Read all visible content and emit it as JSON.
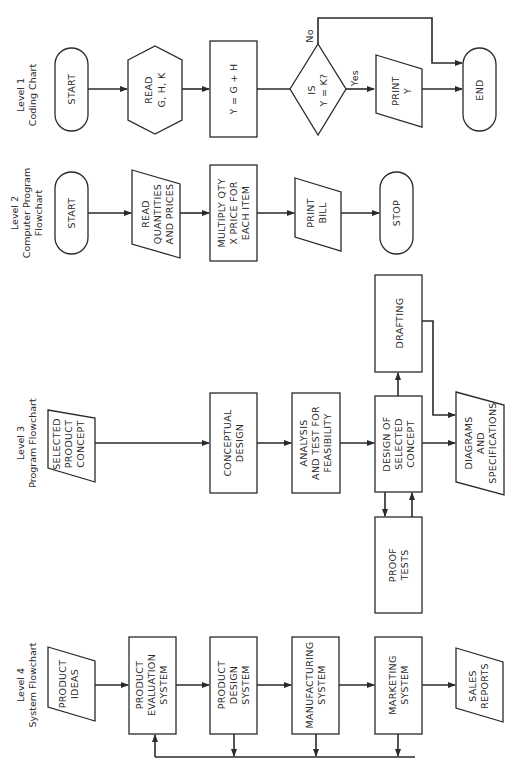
{
  "diagram": {
    "orientation": "rotated 90 degrees counter-clockwise (text reads bottom-to-top)",
    "levels": [
      {
        "id": "level1",
        "title_line1": "Level 1",
        "title_line2": "Coding Chart",
        "nodes": [
          {
            "id": "l1_start",
            "shape": "terminal",
            "lines": [
              "START"
            ]
          },
          {
            "id": "l1_read",
            "shape": "hexagon",
            "lines": [
              "READ",
              "G, H, K"
            ]
          },
          {
            "id": "l1_compute",
            "shape": "process",
            "lines": [
              "Y = G + H"
            ]
          },
          {
            "id": "l1_decision",
            "shape": "decision",
            "lines": [
              "IS",
              "Y = K?"
            ]
          },
          {
            "id": "l1_print",
            "shape": "io",
            "lines": [
              "PRINT",
              "Y"
            ]
          },
          {
            "id": "l1_end",
            "shape": "terminal",
            "lines": [
              "END"
            ]
          }
        ],
        "edge_labels": {
          "yes": "Yes",
          "no": "No"
        }
      },
      {
        "id": "level2",
        "title_line1": "Level 2",
        "title_line2": "Computer Program",
        "title_line3": "Flowchart",
        "nodes": [
          {
            "id": "l2_start",
            "shape": "terminal",
            "lines": [
              "START"
            ]
          },
          {
            "id": "l2_read",
            "shape": "io",
            "lines": [
              "READ",
              "QUANTITIES",
              "AND PRICES"
            ]
          },
          {
            "id": "l2_multiply",
            "shape": "process",
            "lines": [
              "MULTIPLY QTY",
              "X PRICE FOR",
              "EACH ITEM"
            ]
          },
          {
            "id": "l2_print",
            "shape": "io",
            "lines": [
              "PRINT",
              "BILL"
            ]
          },
          {
            "id": "l2_stop",
            "shape": "terminal",
            "lines": [
              "STOP"
            ]
          }
        ]
      },
      {
        "id": "level3",
        "title_line1": "Level 3",
        "title_line2": "Program Flowchart",
        "nodes": [
          {
            "id": "l3_selected",
            "shape": "io",
            "lines": [
              "SELECTED",
              "PRODUCT",
              "CONCEPT"
            ]
          },
          {
            "id": "l3_conceptual",
            "shape": "process",
            "lines": [
              "CONCEPTUAL",
              "DESIGN"
            ]
          },
          {
            "id": "l3_analysis",
            "shape": "process",
            "lines": [
              "ANALYSIS",
              "AND TEST FOR",
              "FEASIBILITY"
            ]
          },
          {
            "id": "l3_design",
            "shape": "process",
            "lines": [
              "DESIGN OF",
              "SELECTED",
              "CONCEPT"
            ]
          },
          {
            "id": "l3_drafting",
            "shape": "process",
            "lines": [
              "DRAFTING"
            ]
          },
          {
            "id": "l3_proof",
            "shape": "process",
            "lines": [
              "PROOF",
              "TESTS"
            ]
          },
          {
            "id": "l3_diagrams",
            "shape": "io",
            "lines": [
              "DIAGRAMS",
              "AND",
              "SPECIFICATIONS"
            ]
          }
        ]
      },
      {
        "id": "level4",
        "title_line1": "Level 4",
        "title_line2": "System Flowchart",
        "nodes": [
          {
            "id": "l4_ideas",
            "shape": "io",
            "lines": [
              "PRODUCT",
              "IDEAS"
            ]
          },
          {
            "id": "l4_evaluation",
            "shape": "process",
            "lines": [
              "PRODUCT",
              "EVALUATION",
              "SYSTEM"
            ]
          },
          {
            "id": "l4_design",
            "shape": "process",
            "lines": [
              "PRODUCT",
              "DESIGN",
              "SYSTEM"
            ]
          },
          {
            "id": "l4_manufacturing",
            "shape": "process",
            "lines": [
              "MANUFACTURING",
              "SYSTEM"
            ]
          },
          {
            "id": "l4_marketing",
            "shape": "process",
            "lines": [
              "MARKETING",
              "SYSTEM"
            ]
          },
          {
            "id": "l4_sales",
            "shape": "io",
            "lines": [
              "SALES",
              "REPORTS"
            ]
          }
        ]
      }
    ],
    "colors": {
      "ink": "#2a2a2a",
      "background": "#ffffff"
    }
  }
}
